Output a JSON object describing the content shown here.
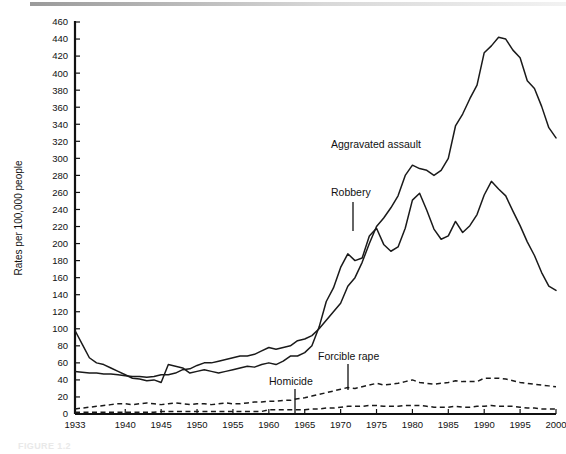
{
  "figure": {
    "caption": "FIGURE 1.2",
    "top_rule": "horizontal-rule"
  },
  "chart_data": {
    "type": "line",
    "title": "",
    "xlabel": "",
    "ylabel": "Rates per 100,000 people",
    "xlim": [
      1933,
      2000
    ],
    "ylim": [
      0,
      460
    ],
    "ytick_step": 20,
    "yticks": [
      0,
      20,
      40,
      60,
      80,
      100,
      120,
      140,
      160,
      180,
      200,
      220,
      240,
      260,
      280,
      300,
      320,
      340,
      360,
      380,
      400,
      420,
      440,
      460
    ],
    "xticks": [
      1933,
      1940,
      1945,
      1950,
      1955,
      1960,
      1965,
      1970,
      1975,
      1980,
      1985,
      1990,
      1995,
      2000
    ],
    "grid": false,
    "legend": "inline-annotations",
    "annotations": [
      {
        "label": "Aggravated assault",
        "series": "Aggravated assault",
        "leader": false
      },
      {
        "label": "Robbery",
        "series": "Robbery",
        "leader": true
      },
      {
        "label": "Homicide",
        "series": "Homicide",
        "leader": true
      },
      {
        "label": "Forcible rape",
        "series": "Forcible rape",
        "leader": true
      }
    ],
    "series": [
      {
        "name": "Aggravated assault",
        "style": "solid",
        "x": [
          1933,
          1934,
          1935,
          1936,
          1937,
          1938,
          1939,
          1940,
          1941,
          1942,
          1943,
          1944,
          1945,
          1946,
          1947,
          1948,
          1949,
          1950,
          1951,
          1952,
          1953,
          1954,
          1955,
          1956,
          1957,
          1958,
          1959,
          1960,
          1961,
          1962,
          1963,
          1964,
          1965,
          1966,
          1967,
          1968,
          1969,
          1970,
          1971,
          1972,
          1973,
          1974,
          1975,
          1976,
          1977,
          1978,
          1979,
          1980,
          1981,
          1982,
          1983,
          1984,
          1985,
          1986,
          1987,
          1988,
          1989,
          1990,
          1991,
          1992,
          1993,
          1994,
          1995,
          1996,
          1997,
          1998,
          1999,
          2000
        ],
        "values": [
          50,
          49,
          48,
          48,
          47,
          47,
          46,
          45,
          44,
          44,
          43,
          44,
          46,
          46,
          48,
          52,
          53,
          57,
          60,
          60,
          62,
          64,
          66,
          68,
          68,
          70,
          74,
          78,
          76,
          78,
          80,
          86,
          88,
          92,
          100,
          110,
          120,
          130,
          150,
          160,
          178,
          200,
          220,
          230,
          242,
          256,
          280,
          292,
          288,
          286,
          280,
          286,
          300,
          338,
          352,
          370,
          386,
          424,
          432,
          442,
          440,
          427,
          418,
          391,
          382,
          361,
          336,
          324
        ]
      },
      {
        "name": "Robbery",
        "style": "solid",
        "x": [
          1933,
          1934,
          1935,
          1936,
          1937,
          1938,
          1939,
          1940,
          1941,
          1942,
          1943,
          1944,
          1945,
          1946,
          1947,
          1948,
          1949,
          1950,
          1951,
          1952,
          1953,
          1954,
          1955,
          1956,
          1957,
          1958,
          1959,
          1960,
          1961,
          1962,
          1963,
          1964,
          1965,
          1966,
          1967,
          1968,
          1969,
          1970,
          1971,
          1972,
          1973,
          1974,
          1975,
          1976,
          1977,
          1978,
          1979,
          1980,
          1981,
          1982,
          1983,
          1984,
          1985,
          1986,
          1987,
          1988,
          1989,
          1990,
          1991,
          1992,
          1993,
          1994,
          1995,
          1996,
          1997,
          1998,
          1999,
          2000
        ],
        "values": [
          98,
          82,
          66,
          60,
          58,
          54,
          50,
          46,
          42,
          41,
          39,
          40,
          37,
          58,
          56,
          54,
          48,
          50,
          52,
          50,
          48,
          50,
          52,
          54,
          56,
          55,
          58,
          60,
          58,
          62,
          68,
          68,
          72,
          80,
          102,
          132,
          148,
          172,
          188,
          180,
          183,
          209,
          218,
          199,
          191,
          196,
          218,
          251,
          259,
          239,
          217,
          205,
          209,
          226,
          213,
          221,
          234,
          257,
          273,
          264,
          256,
          238,
          221,
          202,
          186,
          166,
          150,
          145
        ]
      },
      {
        "name": "Forcible rape",
        "style": "dashed",
        "x": [
          1933,
          1934,
          1935,
          1936,
          1937,
          1938,
          1939,
          1940,
          1941,
          1942,
          1943,
          1944,
          1945,
          1946,
          1947,
          1948,
          1949,
          1950,
          1951,
          1952,
          1953,
          1954,
          1955,
          1956,
          1957,
          1958,
          1959,
          1960,
          1961,
          1962,
          1963,
          1964,
          1965,
          1966,
          1967,
          1968,
          1969,
          1970,
          1971,
          1972,
          1973,
          1974,
          1975,
          1976,
          1977,
          1978,
          1979,
          1980,
          1981,
          1982,
          1983,
          1984,
          1985,
          1986,
          1987,
          1988,
          1989,
          1990,
          1991,
          1992,
          1993,
          1994,
          1995,
          1996,
          1997,
          1998,
          1999,
          2000
        ],
        "values": [
          6,
          7,
          8,
          9,
          10,
          11,
          12,
          12,
          11,
          12,
          13,
          12,
          11,
          12,
          13,
          12,
          11,
          12,
          12,
          11,
          12,
          13,
          12,
          12,
          13,
          14,
          14,
          15,
          15,
          16,
          16,
          18,
          19,
          21,
          23,
          25,
          27,
          29,
          31,
          30,
          32,
          34,
          36,
          34,
          35,
          36,
          38,
          40,
          37,
          36,
          35,
          36,
          37,
          39,
          38,
          38,
          38,
          42,
          42,
          42,
          41,
          39,
          37,
          36,
          35,
          34,
          33,
          32
        ]
      },
      {
        "name": "Homicide",
        "style": "dashed",
        "x": [
          1933,
          1934,
          1935,
          1936,
          1937,
          1938,
          1939,
          1940,
          1941,
          1942,
          1943,
          1944,
          1945,
          1946,
          1947,
          1948,
          1949,
          1950,
          1951,
          1952,
          1953,
          1954,
          1955,
          1956,
          1957,
          1958,
          1959,
          1960,
          1961,
          1962,
          1963,
          1964,
          1965,
          1966,
          1967,
          1968,
          1969,
          1970,
          1971,
          1972,
          1973,
          1974,
          1975,
          1976,
          1977,
          1978,
          1979,
          1980,
          1981,
          1982,
          1983,
          1984,
          1985,
          1986,
          1987,
          1988,
          1989,
          1990,
          1991,
          1992,
          1993,
          1994,
          1995,
          1996,
          1997,
          1998,
          1999,
          2000
        ],
        "values": [
          2,
          2,
          2,
          2,
          2,
          2,
          2,
          2,
          2,
          2,
          2,
          2,
          3,
          3,
          3,
          3,
          3,
          3,
          3,
          3,
          3,
          3,
          3,
          3,
          3,
          3,
          3,
          5,
          5,
          5,
          5,
          5,
          5,
          6,
          6,
          7,
          7,
          8,
          9,
          9,
          9,
          10,
          10,
          9,
          9,
          9,
          10,
          10,
          10,
          9,
          8,
          8,
          8,
          9,
          8,
          8,
          9,
          9,
          10,
          9,
          9,
          9,
          8,
          7,
          7,
          6,
          6,
          6
        ]
      }
    ]
  },
  "annotation_labels": {
    "aggravated_assault": "Aggravated assault",
    "robbery": "Robbery",
    "homicide": "Homicide",
    "forcible_rape": "Forcible rape"
  }
}
